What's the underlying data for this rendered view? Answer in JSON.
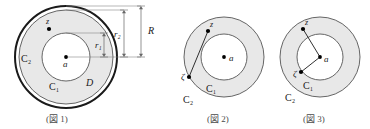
{
  "document": {
    "kind": "mathematical-figure-set",
    "background_color": "#ffffff",
    "figure_count": 3
  },
  "palette": {
    "stroke": "#1a1a1a",
    "thin_stroke": "#555555",
    "annulus_fill": "#e8e8e8",
    "inner_fill": "#ffffff",
    "dimension_line": "#666666",
    "caption_color": "#4a4a4a",
    "point_fill": "#000000"
  },
  "figures": [
    {
      "id": "figure-1",
      "caption": "(図 1)",
      "center": {
        "cx": 66,
        "cy": 57,
        "label": "a"
      },
      "circles": [
        {
          "name": "outer-boundary-R",
          "r": 51,
          "stroke_width": 2.0,
          "label": null
        },
        {
          "name": "circle-C2-r2",
          "r": 47,
          "stroke_width": 0.9,
          "label": "C₂"
        },
        {
          "name": "circle-C1-r1",
          "r": 24,
          "stroke_width": 0.9,
          "label": "C₁"
        }
      ],
      "region_label": "D",
      "labels": {
        "center": "a",
        "outer_circle": "C₂",
        "inner_circle": "C₁",
        "annulus_region": "D",
        "point": "z"
      },
      "point_z": {
        "x": 49,
        "y": 29,
        "label": "z"
      },
      "dimensions": [
        {
          "name": "r1",
          "label": "r₁",
          "from_y": 57,
          "to_y": 33,
          "x": 104
        },
        {
          "name": "r2",
          "label": "r₂",
          "from_y": 57,
          "to_y": 10,
          "x": 124
        },
        {
          "name": "R",
          "label": "R",
          "from_y": 57,
          "to_y": 6,
          "x": 141
        }
      ]
    },
    {
      "id": "figure-2",
      "caption": "(図 2)",
      "center": {
        "cx": 224,
        "cy": 57,
        "label": "a"
      },
      "circles": [
        {
          "name": "circle-C2",
          "r": 40,
          "stroke_width": 0.9,
          "label": "C₂"
        },
        {
          "name": "circle-C1",
          "r": 23,
          "stroke_width": 0.9,
          "label": "C₁"
        }
      ],
      "labels": {
        "center": "a",
        "outer_circle": "C₂",
        "inner_circle": "C₁",
        "point_z": "z",
        "point_zeta": "ζ"
      },
      "point_z": {
        "x": 208,
        "y": 31,
        "label": "z"
      },
      "point_zeta": {
        "x": 189,
        "y": 77,
        "label": "ζ"
      },
      "segment": {
        "name": "ray-through-center",
        "from": "z",
        "through": "a",
        "to": "ζ"
      }
    },
    {
      "id": "figure-3",
      "caption": "(図 3)",
      "center": {
        "cx": 320,
        "cy": 57,
        "label": "a"
      },
      "circles": [
        {
          "name": "circle-C2",
          "r": 40,
          "stroke_width": 0.9,
          "label": "C₂"
        },
        {
          "name": "circle-C1",
          "r": 23,
          "stroke_width": 0.9,
          "label": "C₁"
        }
      ],
      "labels": {
        "center": "a",
        "outer_circle": "C₂",
        "inner_circle": "C₁",
        "point_z": "z",
        "point_zeta": "ζ"
      },
      "point_z": {
        "x": 303,
        "y": 29,
        "label": "z"
      },
      "point_zeta": {
        "x": 301,
        "y": 72,
        "label": "ζ"
      },
      "segments": [
        {
          "name": "segment-a-z",
          "from": "a",
          "to": "z"
        },
        {
          "name": "segment-a-zeta",
          "from": "a",
          "to": "ζ"
        }
      ]
    }
  ]
}
